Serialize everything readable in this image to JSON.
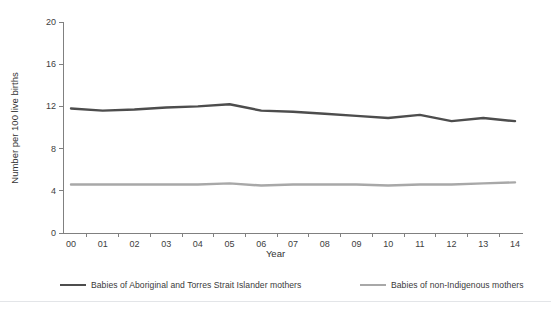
{
  "chart_data": {
    "type": "line",
    "title": "",
    "xlabel": "Year",
    "ylabel": "Number per 100 live births",
    "x": [
      "00",
      "01",
      "02",
      "03",
      "04",
      "05",
      "06",
      "07",
      "08",
      "09",
      "10",
      "11",
      "12",
      "13",
      "14"
    ],
    "xtick_labels": [
      "00",
      "01",
      "02",
      "03",
      "04",
      "05",
      "06",
      "07",
      "08",
      "09",
      "10",
      "11",
      "12",
      "13",
      "14"
    ],
    "ytick_labels": [
      "0",
      "4",
      "8",
      "12",
      "16",
      "20"
    ],
    "ytick_values": [
      0,
      4,
      8,
      12,
      16,
      20
    ],
    "ylim": [
      0,
      20
    ],
    "grid": false,
    "legend_position": "bottom",
    "series": [
      {
        "name": "Babies of Aboriginal and Torres Strait Islander mothers",
        "color": "#4d4d4d",
        "values": [
          11.8,
          11.6,
          11.7,
          11.9,
          12.0,
          12.2,
          11.6,
          11.5,
          11.3,
          11.1,
          10.9,
          11.2,
          10.6,
          10.9,
          10.6
        ]
      },
      {
        "name": "Babies of non-Indigenous mothers",
        "color": "#a8a8a8",
        "values": [
          4.6,
          4.6,
          4.6,
          4.6,
          4.6,
          4.7,
          4.5,
          4.6,
          4.6,
          4.6,
          4.5,
          4.6,
          4.6,
          4.7,
          4.8
        ]
      }
    ]
  },
  "axis": {
    "y_title": "Number per 100 live births",
    "x_title": "Year"
  },
  "legend": {
    "items": [
      {
        "label": "Babies of Aboriginal and Torres Strait Islander mothers",
        "color": "#4d4d4d"
      },
      {
        "label": "Babies of non-Indigenous mothers",
        "color": "#a8a8a8"
      }
    ]
  },
  "colors": {
    "axis": "#808080",
    "series_dark": "#4d4d4d",
    "series_light": "#a8a8a8",
    "divider": "#e3e5e8",
    "background": "#ffffff"
  }
}
